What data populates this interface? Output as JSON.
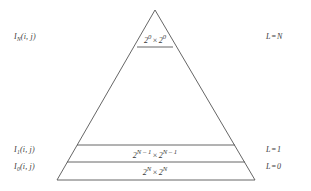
{
  "figure": {
    "type": "image-pyramid-diagram",
    "background_color": "#ffffff",
    "line_color": "#555555",
    "text_color": "#3a3a3a"
  },
  "levels": [
    {
      "id": "top",
      "left_label_base": "I",
      "left_label_sub": "N",
      "left_label_args": "(i, j)",
      "size_base": "2",
      "size_exp": "0",
      "size_times": "×",
      "size_text": "2⁰ × 2⁰",
      "right_label_var": "L",
      "right_label_eq": "=",
      "right_label_value": "N"
    },
    {
      "id": "middle",
      "left_label_base": "I",
      "left_label_sub": "1",
      "left_label_args": "(i, j)",
      "size_base": "2",
      "size_exp": "N – 1",
      "size_times": "×",
      "size_text": "2^(N-1) × 2^(N-1)",
      "right_label_var": "L",
      "right_label_eq": "=",
      "right_label_value": "1"
    },
    {
      "id": "bottom",
      "left_label_base": "I",
      "left_label_sub": "0",
      "left_label_args": "(i, j)",
      "size_base": "2",
      "size_exp": "N",
      "size_times": "×",
      "size_text": "2^N × 2^N",
      "right_label_var": "L",
      "right_label_eq": "=",
      "right_label_value": "0"
    }
  ],
  "geometry": {
    "apex_x": 155,
    "apex_y": 10,
    "base_left_x": 57,
    "base_right_x": 255,
    "base_y": 180,
    "divider_top_y": 47,
    "divider_middle_y": 145,
    "divider_bottom_y": 162
  }
}
